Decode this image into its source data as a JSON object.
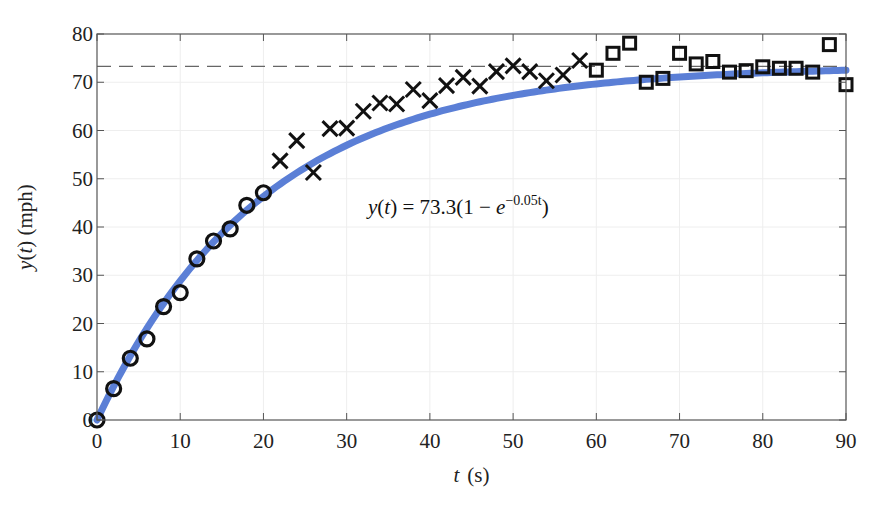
{
  "chart_data": {
    "type": "scatter",
    "title": "",
    "xlabel": "t (s)",
    "xlabel_var": "t",
    "xlabel_unit": "(s)",
    "ylabel": "y(t) (mph)",
    "xlim": [
      0,
      90
    ],
    "ylim": [
      0,
      80
    ],
    "xticks": [
      0,
      10,
      20,
      30,
      40,
      50,
      60,
      70,
      80,
      90
    ],
    "yticks": [
      0,
      10,
      20,
      30,
      40,
      50,
      60,
      70,
      80
    ],
    "grid": true,
    "legend": null,
    "annotation": {
      "text": "y(t) = 73.3(1 − e^(−0.05t))",
      "lhs": "y(t) = 73.3(1 − ",
      "base": "e",
      "exponent": "−0.05t",
      "rhs": ")",
      "x": 44,
      "y": 44
    },
    "reference_line": {
      "y": 73.3,
      "style": "dashed",
      "color": "#666666"
    },
    "fit_curve": {
      "name": "y(t) = 73.3(1 - e^(-0.05t))",
      "A": 73.3,
      "k": 0.05,
      "color": "#5b7fd6",
      "width": 7
    },
    "series": [
      {
        "name": "circles",
        "marker": "circle",
        "x": [
          0,
          2,
          4,
          6,
          8,
          10,
          12,
          14,
          16,
          18,
          20
        ],
        "values": [
          0,
          6.5,
          12.8,
          16.8,
          23.5,
          26.4,
          33.4,
          37.1,
          39.6,
          44.5,
          47.1
        ]
      },
      {
        "name": "crosses",
        "marker": "x",
        "x": [
          22,
          24,
          26,
          28,
          30,
          32,
          34,
          36,
          38,
          40,
          42,
          44,
          46,
          48,
          50,
          52,
          54,
          56,
          58
        ],
        "values": [
          53.7,
          57.9,
          51.3,
          60.4,
          60.5,
          64.0,
          65.7,
          65.5,
          68.5,
          66.2,
          69.3,
          71.0,
          69.2,
          72.2,
          73.4,
          72.2,
          70.3,
          71.5,
          74.5
        ]
      },
      {
        "name": "squares",
        "marker": "square",
        "x": [
          60,
          62,
          64,
          66,
          68,
          70,
          72,
          74,
          76,
          78,
          80,
          82,
          84,
          86,
          88,
          90
        ],
        "values": [
          72.5,
          76.0,
          78.1,
          70.0,
          70.8,
          76.0,
          73.8,
          74.3,
          72.1,
          72.4,
          73.2,
          72.9,
          72.9,
          72.1,
          77.8,
          69.5
        ]
      }
    ]
  }
}
